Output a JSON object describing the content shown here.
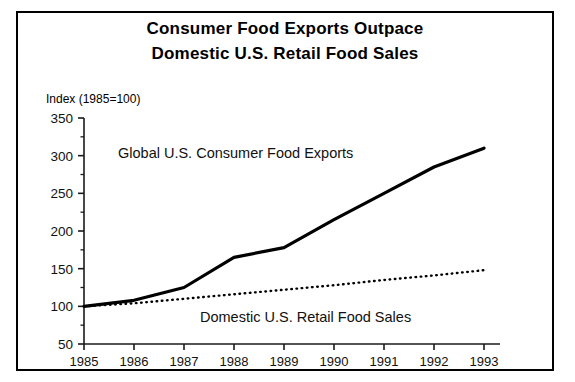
{
  "figure": {
    "title_line1": "Consumer Food Exports Outpace",
    "title_line2": "Domestic U.S. Retail Food Sales",
    "index_note": "Index (1985=100)",
    "frame_color": "#000000",
    "background_color": "#ffffff"
  },
  "chart_data": {
    "type": "line",
    "title": "Consumer Food Exports Outpace Domestic U.S. Retail Food Sales",
    "subtitle": "",
    "xlabel": "",
    "ylabel": "Index (1985=100)",
    "x": [
      1985,
      1986,
      1987,
      1988,
      1989,
      1990,
      1991,
      1992,
      1993
    ],
    "categories": [
      "1985",
      "1986",
      "1987",
      "1988",
      "1989",
      "1990",
      "1991",
      "1992",
      "1993"
    ],
    "xlim": [
      1985,
      1993
    ],
    "ylim": [
      50,
      350
    ],
    "yticks": [
      50,
      100,
      150,
      200,
      250,
      300,
      350
    ],
    "ytick_labels": [
      "50",
      "100",
      "150",
      "200",
      "250",
      "300",
      "350"
    ],
    "minor_yticks": [
      75,
      125,
      175,
      225,
      275,
      325
    ],
    "grid": false,
    "legend_position": "inline-annotations",
    "series": [
      {
        "name": "Global U.S. Consumer Food Exports",
        "style": "solid",
        "color": "#000000",
        "line_width": 3.2,
        "values": [
          100,
          108,
          125,
          165,
          178,
          215,
          250,
          285,
          310
        ],
        "annotation": "Global U.S. Consumer Food Exports"
      },
      {
        "name": "Domestic U.S. Retail Food Sales",
        "style": "dotted",
        "color": "#000000",
        "line_width": 2.4,
        "values": [
          100,
          104,
          110,
          116,
          122,
          128,
          135,
          141,
          148
        ],
        "annotation": "Domestic U.S. Retail Food Sales"
      }
    ]
  }
}
